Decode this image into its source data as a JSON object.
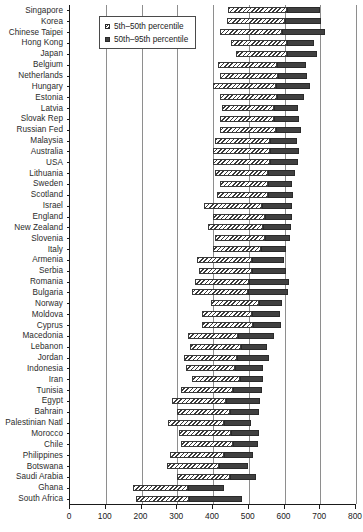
{
  "chart_data": {
    "type": "bar",
    "orientation": "horizontal",
    "title": "",
    "subtitle": "",
    "xlabel": "",
    "ylabel": "",
    "xlim": [
      0,
      800
    ],
    "ylim": null,
    "grid": true,
    "grid_axis": "x",
    "legend_position": "top-left",
    "xticks": [
      0,
      100,
      200,
      300,
      400,
      500,
      600,
      700,
      800
    ],
    "xtick_labels": [
      "0",
      "100",
      "200",
      "300",
      "400",
      "500",
      "600",
      "700",
      "800"
    ],
    "categories": [
      "Singapore",
      "Korea",
      "Chinese Taipei",
      "Hong Kong",
      "Japan",
      "Belgium",
      "Netherlands",
      "Hungary",
      "Estonia",
      "Latvia",
      "Slovak Rep",
      "Russian Fed",
      "Malaysia",
      "Australia",
      "USA",
      "Lithuania",
      "Sweden",
      "Scotland",
      "Israel",
      "England",
      "New Zealand",
      "Slovenia",
      "Italy",
      "Armenia",
      "Serbia",
      "Romania",
      "Bulgaria",
      "Norway",
      "Moldova",
      "Cyprus",
      "Macedonia",
      "Lebanon",
      "Jordan",
      "Indonesia",
      "Iran",
      "Tunisia",
      "Egypt",
      "Bahrain",
      "Palestinian Natl",
      "Morocco",
      "Chile",
      "Philippines",
      "Botswana",
      "Saudi Arabia",
      "Ghana",
      "South Africa"
    ],
    "series": [
      {
        "name": "5th-50th percentile",
        "key": "low",
        "fill": "hatched",
        "values": [
          442,
          440,
          420,
          450,
          465,
          415,
          420,
          400,
          420,
          425,
          420,
          420,
          405,
          400,
          400,
          405,
          420,
          410,
          375,
          400,
          385,
          405,
          400,
          355,
          360,
          350,
          340,
          395,
          370,
          370,
          330,
          335,
          320,
          325,
          340,
          310,
          285,
          300,
          275,
          305,
          310,
          280,
          270,
          300,
          175,
          185
        ]
      },
      {
        "name": "50th-95th percentile",
        "key": "high",
        "fill": "solid",
        "values": [
          607,
          602,
          592,
          607,
          607,
          580,
          583,
          575,
          578,
          570,
          572,
          575,
          560,
          560,
          560,
          555,
          555,
          555,
          538,
          545,
          540,
          545,
          533,
          508,
          510,
          502,
          498,
          530,
          510,
          513,
          470,
          478,
          468,
          462,
          475,
          455,
          435,
          447,
          430,
          450,
          455,
          430,
          418,
          448,
          330,
          332
        ]
      }
    ],
    "bar_ends": [
      {
        "low_start": 442,
        "low_end": 607,
        "high_end": 700
      },
      {
        "low_start": 440,
        "low_end": 602,
        "high_end": 702
      },
      {
        "low_start": 420,
        "low_end": 592,
        "high_end": 712
      },
      {
        "low_start": 450,
        "low_end": 607,
        "high_end": 682
      },
      {
        "low_start": 465,
        "low_end": 607,
        "high_end": 690
      },
      {
        "low_start": 415,
        "low_end": 580,
        "high_end": 660
      },
      {
        "low_start": 420,
        "low_end": 583,
        "high_end": 662
      },
      {
        "low_start": 400,
        "low_end": 575,
        "high_end": 672
      },
      {
        "low_start": 420,
        "low_end": 578,
        "high_end": 655
      },
      {
        "low_start": 425,
        "low_end": 570,
        "high_end": 638
      },
      {
        "low_start": 420,
        "low_end": 572,
        "high_end": 640
      },
      {
        "low_start": 420,
        "low_end": 575,
        "high_end": 645
      },
      {
        "low_start": 405,
        "low_end": 560,
        "high_end": 635
      },
      {
        "low_start": 400,
        "low_end": 560,
        "high_end": 640
      },
      {
        "low_start": 400,
        "low_end": 560,
        "high_end": 638
      },
      {
        "low_start": 405,
        "low_end": 555,
        "high_end": 628
      },
      {
        "low_start": 420,
        "low_end": 555,
        "high_end": 620
      },
      {
        "low_start": 410,
        "low_end": 555,
        "high_end": 625
      },
      {
        "low_start": 375,
        "low_end": 538,
        "high_end": 622
      },
      {
        "low_start": 400,
        "low_end": 545,
        "high_end": 620
      },
      {
        "low_start": 385,
        "low_end": 540,
        "high_end": 618
      },
      {
        "low_start": 405,
        "low_end": 545,
        "high_end": 615
      },
      {
        "low_start": 400,
        "low_end": 533,
        "high_end": 605
      },
      {
        "low_start": 355,
        "low_end": 508,
        "high_end": 600
      },
      {
        "low_start": 360,
        "low_end": 510,
        "high_end": 605
      },
      {
        "low_start": 350,
        "low_end": 502,
        "high_end": 612
      },
      {
        "low_start": 340,
        "low_end": 498,
        "high_end": 610
      },
      {
        "low_start": 395,
        "low_end": 530,
        "high_end": 592
      },
      {
        "low_start": 370,
        "low_end": 510,
        "high_end": 588
      },
      {
        "low_start": 370,
        "low_end": 513,
        "high_end": 590
      },
      {
        "low_start": 330,
        "low_end": 470,
        "high_end": 570
      },
      {
        "low_start": 335,
        "low_end": 478,
        "high_end": 552
      },
      {
        "low_start": 320,
        "low_end": 468,
        "high_end": 558
      },
      {
        "low_start": 325,
        "low_end": 462,
        "high_end": 540
      },
      {
        "low_start": 340,
        "low_end": 475,
        "high_end": 540
      },
      {
        "low_start": 310,
        "low_end": 455,
        "high_end": 538
      },
      {
        "low_start": 285,
        "low_end": 435,
        "high_end": 532
      },
      {
        "low_start": 300,
        "low_end": 447,
        "high_end": 528
      },
      {
        "low_start": 275,
        "low_end": 430,
        "high_end": 505
      },
      {
        "low_start": 305,
        "low_end": 450,
        "high_end": 530
      },
      {
        "low_start": 310,
        "low_end": 455,
        "high_end": 525
      },
      {
        "low_start": 280,
        "low_end": 430,
        "high_end": 512
      },
      {
        "low_start": 270,
        "low_end": 418,
        "high_end": 498
      },
      {
        "low_start": 300,
        "low_end": 448,
        "high_end": 520
      },
      {
        "low_start": 175,
        "low_end": 330,
        "high_end": 430
      },
      {
        "low_start": 185,
        "low_end": 332,
        "high_end": 480
      }
    ]
  },
  "legend": {
    "entries": [
      {
        "label": "5th–50th percentile",
        "swatch": "low"
      },
      {
        "label": "50th–95th percentile",
        "swatch": "high"
      }
    ]
  },
  "colors": {
    "hatch_line": "#3a3a3a",
    "solid_fill": "#404040",
    "gridline": "#8e8e8e",
    "axis": "#1a1a1a",
    "label_text": "#2b2b2b",
    "background": "#ffffff"
  }
}
